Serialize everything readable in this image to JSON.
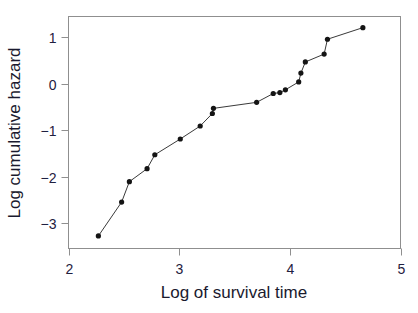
{
  "chart_data": {
    "type": "scatter",
    "title": "",
    "xlabel": "Log of survival time",
    "ylabel": "Log cumulative hazard",
    "xlim": [
      2,
      5
    ],
    "ylim": [
      -3.55,
      1.45
    ],
    "xticks": [
      2,
      3,
      4,
      5
    ],
    "xtick_labels": [
      "2",
      "3",
      "4",
      "5"
    ],
    "yticks": [
      1,
      0,
      -1,
      -2,
      -3
    ],
    "ytick_labels": [
      "1",
      "0",
      "-1",
      "-2",
      "-3"
    ],
    "grid": false,
    "legend": null,
    "marker": "filled-circle",
    "line": "solid",
    "series": [
      {
        "name": "log cumulative hazard",
        "color": "#1a1a1a",
        "x": [
          2.27,
          2.48,
          2.55,
          2.71,
          2.78,
          3.01,
          3.19,
          3.3,
          3.31,
          3.7,
          3.85,
          3.91,
          3.96,
          4.08,
          4.1,
          4.14,
          4.31,
          4.34,
          4.66
        ],
        "y": [
          -3.28,
          -2.55,
          -2.11,
          -1.83,
          -1.53,
          -1.19,
          -0.91,
          -0.64,
          -0.53,
          -0.4,
          -0.21,
          -0.19,
          -0.13,
          0.04,
          0.23,
          0.47,
          0.64,
          0.96,
          1.21
        ]
      }
    ]
  },
  "figure": {
    "background": "#ffffff",
    "axis_color": "#8a8a8a",
    "text_color": "#1f2040",
    "marker_color": "#141414",
    "line_color": "#3a3a3a"
  },
  "axes": {
    "x_axis_label": "Log of survival time",
    "y_axis_label": "Log cumulative hazard"
  }
}
